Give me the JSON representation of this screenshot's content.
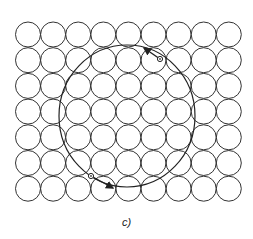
{
  "figure": {
    "caption": "c)",
    "grid": {
      "rows": 7,
      "cols": 9,
      "origin_x": 15.5,
      "origin_y": 22,
      "pitch_x": 25.1,
      "pitch_y": 25.7,
      "radius": 12.5,
      "stroke": "#333333"
    },
    "orbit": {
      "cx": 127,
      "cy": 116,
      "rx": 68,
      "ry": 71,
      "stroke": "#222222"
    },
    "markers": [
      {
        "name": "upper-particle",
        "x": 160,
        "y": 59,
        "arrow_to": [
          144,
          48
        ]
      },
      {
        "name": "lower-particle",
        "x": 91,
        "y": 176,
        "arrow_to": [
          113,
          188
        ]
      }
    ]
  }
}
